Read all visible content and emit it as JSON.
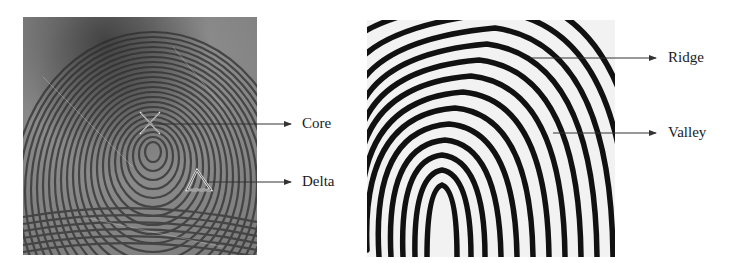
{
  "figure": {
    "left_panel": {
      "description": "Grayscale fingerprint impression (whorl/loop pattern)",
      "annotations": [
        {
          "label": "Core",
          "marker": "x-cross"
        },
        {
          "label": "Delta",
          "marker": "triangle"
        }
      ]
    },
    "right_panel": {
      "description": "Enhanced binary fingerprint ridge pattern",
      "annotations": [
        {
          "label": "Ridge"
        },
        {
          "label": "Valley"
        }
      ]
    }
  },
  "colors": {
    "background": "#ffffff",
    "label_text": "#1a1a1a",
    "arrow": "#333333",
    "left_dark": "#3a3a3a",
    "left_light": "#bdbdbd",
    "right_ridge": "#111111",
    "right_valley": "#f2f2f2"
  }
}
